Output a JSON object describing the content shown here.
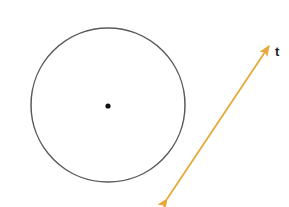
{
  "figure": {
    "canvas": {
      "width": 289,
      "height": 207,
      "background": "#ffffff"
    },
    "shapes": {
      "circle": {
        "name": "circle",
        "cx": 108,
        "cy": 105,
        "r": 77,
        "stroke": "#5a5a5a",
        "stroke_width": 1.5,
        "fill": "none"
      },
      "center_point": {
        "name": "center-point",
        "cx": 108,
        "cy": 106,
        "r": 2.6,
        "fill": "#111111"
      },
      "line_t": {
        "name": "line-t",
        "x1": 167,
        "y1": 199,
        "x2": 269,
        "y2": 46,
        "color": "#e5a93a",
        "stroke_width": 1.8,
        "arrow_start": true,
        "arrow_end": true
      }
    },
    "labels": {
      "t": {
        "text": "t",
        "x": 275,
        "y": 45,
        "color": "#1c1c1c",
        "font_size": 13,
        "font_weight": "bold"
      }
    },
    "colors": {
      "background": "#ffffff",
      "circle_stroke": "#5a5a5a",
      "center_dot": "#111111",
      "arrow": "#e5a93a",
      "label": "#1c1c1c"
    }
  }
}
